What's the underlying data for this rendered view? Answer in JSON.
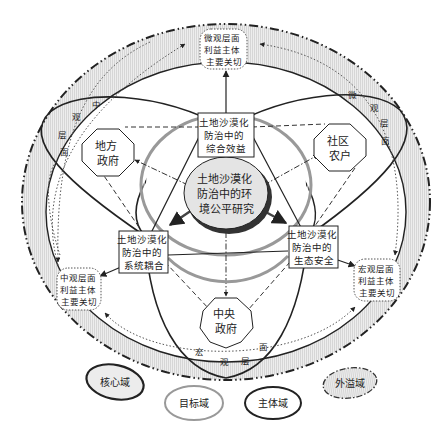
{
  "diagram": {
    "core": {
      "lines": [
        "土地沙漠化",
        "防治中的环",
        "境公平研究"
      ]
    },
    "goals": [
      {
        "id": "comprehensive-benefit",
        "lines": [
          "土地沙漠化",
          "防治中的",
          "综合效益"
        ]
      },
      {
        "id": "system-coupling",
        "lines": [
          "土地沙漠化",
          "防治中的",
          "系统耦合"
        ]
      },
      {
        "id": "ecological-security",
        "lines": [
          "土地沙漠化",
          "防治中的",
          "生态安全"
        ]
      }
    ],
    "subjects": [
      {
        "id": "local-government",
        "lines": [
          "地方",
          "政府"
        ]
      },
      {
        "id": "community-farmers",
        "lines": [
          "社区",
          "农户"
        ]
      },
      {
        "id": "central-government",
        "lines": [
          "中央",
          "政府"
        ]
      }
    ],
    "concerns": [
      {
        "id": "micro-level",
        "lines": [
          "微观层面",
          "利益主体",
          "主要关切"
        ]
      },
      {
        "id": "meso-level",
        "lines": [
          "中观层面",
          "利益主体",
          "主要关切"
        ]
      },
      {
        "id": "macro-level",
        "lines": [
          "宏观层面",
          "利益主体",
          "主要关切"
        ]
      }
    ],
    "levels": {
      "meso": [
        "中",
        "观",
        "层",
        "面"
      ],
      "micro": [
        "微",
        "观",
        "层",
        "面"
      ],
      "macro": [
        "宏",
        "观",
        "层",
        "面"
      ]
    },
    "legend": [
      {
        "id": "core-domain",
        "label": "核心域"
      },
      {
        "id": "goal-domain",
        "label": "目标域"
      },
      {
        "id": "subject-domain",
        "label": "主体域"
      },
      {
        "id": "spillover-domain",
        "label": "外溢域"
      }
    ]
  },
  "colors": {
    "line": "#222222",
    "ring": "#888888",
    "shade": "#e6e6e6",
    "core_fill": "#e0e0e0"
  }
}
